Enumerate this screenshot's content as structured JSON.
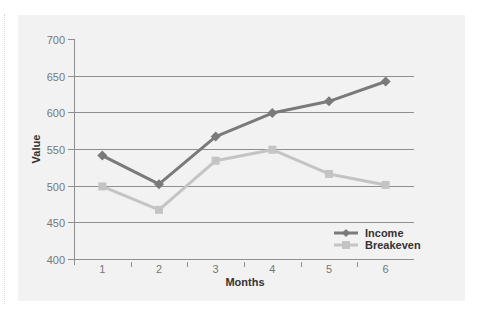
{
  "chart_data": {
    "type": "line",
    "title": "",
    "xlabel": "Months",
    "ylabel": "Value",
    "categories": [
      "1",
      "2",
      "3",
      "4",
      "5",
      "6"
    ],
    "yticks": [
      400,
      450,
      500,
      550,
      600,
      650,
      700
    ],
    "ylim": [
      400,
      700
    ],
    "grid": true,
    "legend_position": "lower right",
    "series": [
      {
        "name": "Income",
        "marker": "diamond",
        "color": "#7a7a7a",
        "values": [
          541,
          502,
          567,
          599,
          615,
          642
        ]
      },
      {
        "name": "Breakeven",
        "marker": "square",
        "color": "#c4c4c4",
        "values": [
          499,
          467,
          534,
          549,
          516,
          501
        ]
      }
    ]
  },
  "colors": {
    "panel_background": "#f2f2f2",
    "gridline": "#8f8f8f",
    "axis": "#8f8f8f"
  }
}
